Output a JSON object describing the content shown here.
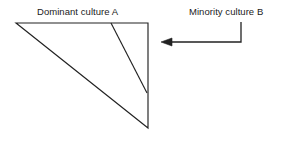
{
  "figure": {
    "background_color": "#ffffff",
    "stroke_color": "#222222",
    "text_color": "#1b1b1b",
    "labels": {
      "dominant": "Dominant culture A",
      "minority": "Minority culture B"
    },
    "shapes": {
      "triangle": {
        "name": "right-triangle",
        "description": "right triangle representing dominant culture A",
        "points": "16,23 148,23 148,128",
        "vertices": [
          {
            "name": "top-left",
            "x": 16,
            "y": 23
          },
          {
            "name": "top-right",
            "x": 148,
            "y": 23
          },
          {
            "name": "bottom-right",
            "x": 148,
            "y": 128
          }
        ]
      },
      "inner_divider": {
        "name": "inner-diagonal-line",
        "description": "diagonal line dividing the minority wedge from the dominant region",
        "x1": 111,
        "y1": 23,
        "x2": 147,
        "y2": 93
      },
      "arrow": {
        "name": "minority-arrow",
        "description": "elbow arrow pointing left toward the triangle edge",
        "path": "M 241,22 L 241,42 L 168,42",
        "tip": {
          "x": 161,
          "y": 42
        },
        "head_points": "161,42 172,38 172,46"
      }
    }
  }
}
